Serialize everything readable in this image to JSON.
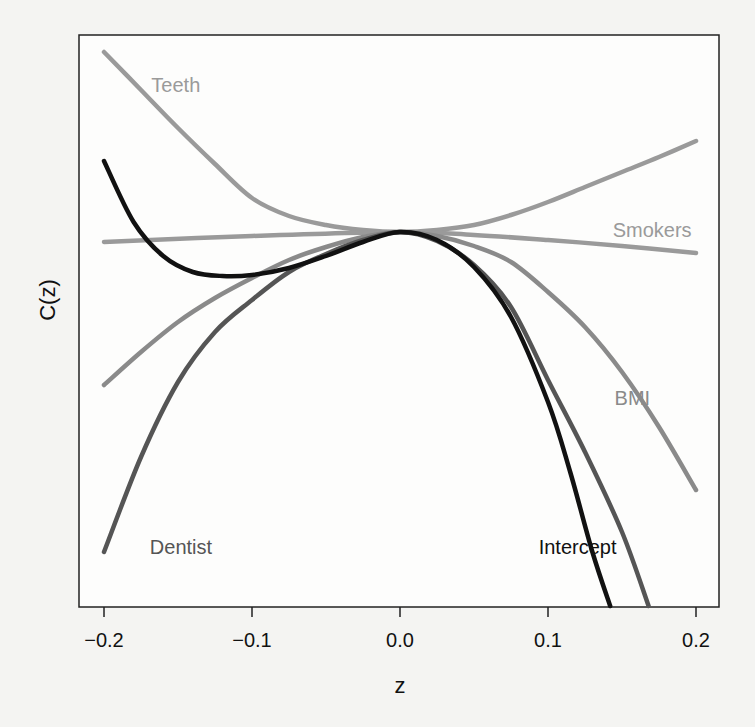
{
  "chart_data": {
    "type": "line",
    "title": "",
    "xlabel": "z",
    "ylabel": "C(z)",
    "xlim": [
      -0.2,
      0.2
    ],
    "ylim": [
      -0.374,
      0.197
    ],
    "y_units_note": "relative units; no y-axis tick labels shown, C(0)=0",
    "grid": false,
    "legend": "inline labels",
    "x_ticks": [
      "-0.2",
      "-0.1",
      "0.0",
      "0.1",
      "0.2"
    ],
    "x_tick_values": [
      -0.2,
      -0.1,
      0.0,
      0.1,
      0.2
    ],
    "series": [
      {
        "name": "Teeth",
        "color": "#9a9a9a",
        "label_pos": {
          "x": -0.168,
          "y": 0.14
        },
        "points": [
          [
            -0.2,
            0.18
          ],
          [
            -0.175,
            0.142
          ],
          [
            -0.15,
            0.104
          ],
          [
            -0.125,
            0.068
          ],
          [
            -0.1,
            0.034
          ],
          [
            -0.075,
            0.016
          ],
          [
            -0.05,
            0.007
          ],
          [
            -0.025,
            0.002
          ],
          [
            0.0,
            0.0
          ],
          [
            0.025,
            0.002
          ],
          [
            0.05,
            0.007
          ],
          [
            0.075,
            0.017
          ],
          [
            0.1,
            0.03
          ],
          [
            0.125,
            0.045
          ],
          [
            0.15,
            0.06
          ],
          [
            0.175,
            0.075
          ],
          [
            0.2,
            0.091
          ]
        ]
      },
      {
        "name": "Smokers",
        "color": "#9a9a9a",
        "label_pos": {
          "x": 0.197,
          "y": -0.005
        },
        "points": [
          [
            -0.2,
            -0.01
          ],
          [
            -0.1,
            -0.004
          ],
          [
            0.0,
            0.0
          ],
          [
            0.05,
            -0.003
          ],
          [
            0.1,
            -0.008
          ],
          [
            0.15,
            -0.014
          ],
          [
            0.2,
            -0.021
          ]
        ]
      },
      {
        "name": "Intercept",
        "color": "#111111",
        "label_pos": {
          "x": 0.12,
          "y": -0.322
        },
        "points": [
          [
            -0.2,
            0.071
          ],
          [
            -0.18,
            0.01
          ],
          [
            -0.16,
            -0.024
          ],
          [
            -0.14,
            -0.04
          ],
          [
            -0.12,
            -0.044
          ],
          [
            -0.1,
            -0.043
          ],
          [
            -0.075,
            -0.036
          ],
          [
            -0.05,
            -0.024
          ],
          [
            -0.025,
            -0.01
          ],
          [
            0.0,
            0.0
          ],
          [
            0.025,
            -0.008
          ],
          [
            0.05,
            -0.035
          ],
          [
            0.075,
            -0.085
          ],
          [
            0.1,
            -0.17
          ],
          [
            0.115,
            -0.24
          ],
          [
            0.13,
            -0.32
          ],
          [
            0.142,
            -0.374
          ]
        ]
      },
      {
        "name": "BMI",
        "color": "#8a8a8a",
        "label_pos": {
          "x": 0.157,
          "y": -0.173
        },
        "points": [
          [
            -0.2,
            -0.153
          ],
          [
            -0.175,
            -0.12
          ],
          [
            -0.15,
            -0.09
          ],
          [
            -0.125,
            -0.066
          ],
          [
            -0.1,
            -0.046
          ],
          [
            -0.075,
            -0.028
          ],
          [
            -0.05,
            -0.015
          ],
          [
            -0.025,
            -0.005
          ],
          [
            0.0,
            0.0
          ],
          [
            0.025,
            -0.004
          ],
          [
            0.05,
            -0.014
          ],
          [
            0.075,
            -0.03
          ],
          [
            0.1,
            -0.06
          ],
          [
            0.125,
            -0.095
          ],
          [
            0.15,
            -0.14
          ],
          [
            0.175,
            -0.195
          ],
          [
            0.2,
            -0.258
          ]
        ]
      },
      {
        "name": "Dentist",
        "color": "#555555",
        "label_pos": {
          "x": -0.148,
          "y": -0.322
        },
        "points": [
          [
            -0.2,
            -0.32
          ],
          [
            -0.175,
            -0.225
          ],
          [
            -0.15,
            -0.15
          ],
          [
            -0.125,
            -0.1
          ],
          [
            -0.1,
            -0.068
          ],
          [
            -0.075,
            -0.04
          ],
          [
            -0.05,
            -0.022
          ],
          [
            -0.025,
            -0.008
          ],
          [
            0.0,
            0.0
          ],
          [
            0.025,
            -0.009
          ],
          [
            0.05,
            -0.033
          ],
          [
            0.075,
            -0.075
          ],
          [
            0.1,
            -0.148
          ],
          [
            0.125,
            -0.22
          ],
          [
            0.15,
            -0.3
          ],
          [
            0.168,
            -0.374
          ]
        ]
      }
    ]
  },
  "plot": {
    "x_axis_label": "z",
    "y_axis_label": "C(z)",
    "tick_labels": [
      "-0.2",
      "-0.1",
      "0.0",
      "0.1",
      "0.2"
    ],
    "tick_labels_display": [
      "−0.2",
      "−0.1",
      "0.0",
      "0.1",
      "0.2"
    ],
    "series_labels": [
      "Teeth",
      "Smokers",
      "Intercept",
      "BMI",
      "Dentist"
    ]
  }
}
